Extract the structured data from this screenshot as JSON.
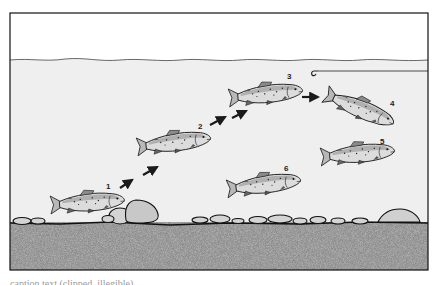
{
  "figure": {
    "type": "illustration",
    "colors": {
      "air": "#ffffff",
      "water": "#efefef",
      "riverbed": "#8a8a8a",
      "outline": "#1a1a1a",
      "fish_body": "#d8d8d8"
    },
    "hook": {
      "present": true,
      "label": "hook-with-line"
    },
    "fish": [
      {
        "id": 1,
        "label": "1",
        "x": 50,
        "y": 193,
        "w": 76,
        "h": 20,
        "angle": -3
      },
      {
        "id": 2,
        "label": "2",
        "x": 136,
        "y": 134,
        "w": 74,
        "h": 22,
        "angle": -6
      },
      {
        "id": 3,
        "label": "3",
        "x": 228,
        "y": 84,
        "w": 72,
        "h": 22,
        "angle": -5
      },
      {
        "id": 4,
        "label": "4",
        "x": 325,
        "y": 84,
        "w": 74,
        "h": 22,
        "angle": 28
      },
      {
        "id": 5,
        "label": "5",
        "x": 320,
        "y": 144,
        "w": 74,
        "h": 20,
        "angle": -4
      },
      {
        "id": 6,
        "label": "6",
        "x": 226,
        "y": 176,
        "w": 74,
        "h": 20,
        "angle": -6
      }
    ],
    "arrows": [
      {
        "x1": 120,
        "y1": 188,
        "x2": 132,
        "y2": 180
      },
      {
        "x1": 143,
        "y1": 175,
        "x2": 157,
        "y2": 167
      },
      {
        "x1": 210,
        "y1": 125,
        "x2": 225,
        "y2": 117
      },
      {
        "x1": 232,
        "y1": 118,
        "x2": 246,
        "y2": 111
      },
      {
        "x1": 302,
        "y1": 97,
        "x2": 318,
        "y2": 97
      }
    ],
    "caption_visible": "caption text (clipped, illegible)"
  }
}
